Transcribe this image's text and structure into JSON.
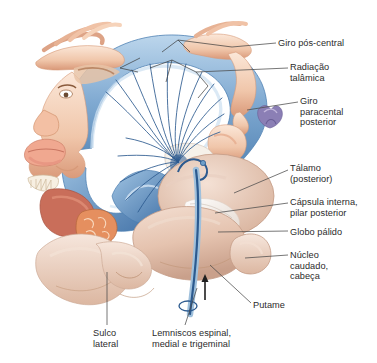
{
  "figure": {
    "kind": "anatomical-illustration",
    "language": "pt-BR",
    "background_color": "#ffffff",
    "text_color": "#2b2b2b"
  },
  "palette": {
    "gyrus_blue_light": "#a8c8e4",
    "gyrus_blue_mid": "#6e9fc9",
    "gyrus_blue_dark": "#3f6fa5",
    "fiber_blue": "#2c5a8f",
    "brain_tan_light": "#efd8c9",
    "brain_tan_mid": "#e2bfab",
    "brain_tan_dark": "#caa18c",
    "skin_light": "#f6dccb",
    "skin_mid": "#eebfa3",
    "skin_dark": "#d99878",
    "tongue_pink": "#f0a890",
    "gum_red": "#b8604f",
    "pharynx_orange": "#e08b5e",
    "white_matter": "#f2ece6",
    "leader_line": "#4a4a4a",
    "foot_purple": "#8b7fb5"
  },
  "labels": [
    {
      "id": "giro-pos-central",
      "lines": [
        "Giro pós-central"
      ],
      "x": 278,
      "y": 38,
      "leader": {
        "x1": 276,
        "y1": 43,
        "x2": 232,
        "y2": 47
      }
    },
    {
      "id": "radiacao-talamica",
      "lines": [
        "Radiação",
        "talâmica"
      ],
      "x": 290,
      "y": 62,
      "leader": {
        "x1": 288,
        "y1": 68,
        "x2": 196,
        "y2": 72
      }
    },
    {
      "id": "giro-paracentral",
      "lines": [
        "Giro",
        "paracental",
        "posterior"
      ],
      "x": 300,
      "y": 96,
      "leader": {
        "x1": 298,
        "y1": 102,
        "x2": 247,
        "y2": 110
      }
    },
    {
      "id": "talamo",
      "lines": [
        "Tálamo",
        "(posterior)"
      ],
      "x": 290,
      "y": 163,
      "leader": {
        "x1": 288,
        "y1": 170,
        "x2": 234,
        "y2": 193
      }
    },
    {
      "id": "capsula-interna",
      "lines": [
        "Cápsula interna,",
        "pilar posterior"
      ],
      "x": 290,
      "y": 197,
      "leader": {
        "x1": 288,
        "y1": 203,
        "x2": 215,
        "y2": 213
      }
    },
    {
      "id": "globo-palido",
      "lines": [
        "Globo pálido"
      ],
      "x": 290,
      "y": 227,
      "leader": {
        "x1": 288,
        "y1": 231,
        "x2": 218,
        "y2": 232
      }
    },
    {
      "id": "nucleo-caudado",
      "lines": [
        "Núcleo",
        "caudado,",
        "cabeça"
      ],
      "x": 290,
      "y": 250,
      "leader": {
        "x1": 288,
        "y1": 255,
        "x2": 245,
        "y2": 258
      }
    },
    {
      "id": "putame",
      "lines": [
        "Putame"
      ],
      "x": 253,
      "y": 300,
      "leader": {
        "x1": 251,
        "y1": 303,
        "x2": 210,
        "y2": 265
      }
    },
    {
      "id": "sulco-lateral",
      "lines": [
        "Sulco",
        "lateral"
      ],
      "x": 93,
      "y": 328,
      "leader": {
        "x1": 107,
        "y1": 325,
        "x2": 107,
        "y2": 272
      }
    },
    {
      "id": "lemniscos",
      "lines": [
        "Lemniscos espinal,",
        "medial e trigeminal"
      ],
      "x": 152,
      "y": 328,
      "leader": {
        "x1": 185,
        "y1": 325,
        "x2": 197,
        "y2": 288
      }
    }
  ],
  "structures": {
    "cortex_band": "postcentral gyrus sensory strip",
    "homunculus_parts": [
      "hand",
      "fingers",
      "arm",
      "face",
      "lips",
      "tongue",
      "teeth-gums",
      "pharynx",
      "foot",
      "toes",
      "genitals"
    ],
    "brain_slice_parts": [
      "thalamus",
      "internal capsule",
      "globus pallidus",
      "caudate nucleus head",
      "putamen",
      "insula",
      "temporal lobe"
    ],
    "tract": {
      "name": "medial lemniscus ascending tract",
      "direction": "upward",
      "color": "#2c5a8f"
    }
  }
}
